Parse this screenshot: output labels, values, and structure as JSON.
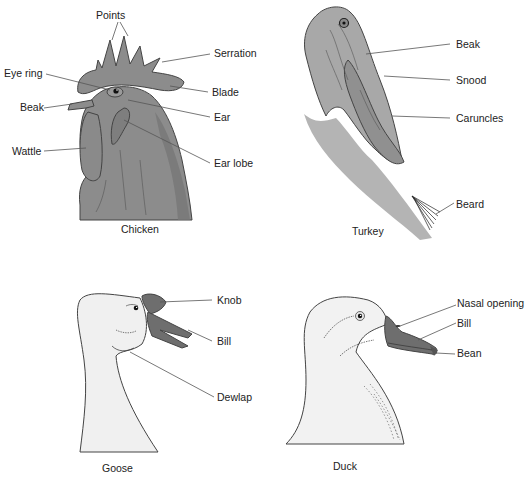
{
  "colors": {
    "background": "#ffffff",
    "chicken_fill": "#8c8c8c",
    "chicken_dark": "#6e6e6e",
    "turkey_fill": "#a8a8a8",
    "turkey_caruncle": "#8a8a8a",
    "bird_body": "#f2f2f2",
    "bill_fill": "#6e6e6e",
    "text": "#222222"
  },
  "panels": {
    "chicken": {
      "caption": "Chicken",
      "labels": {
        "points": "Points",
        "serration": "Serration",
        "eye_ring": "Eye ring",
        "blade": "Blade",
        "beak": "Beak",
        "ear": "Ear",
        "wattle": "Wattle",
        "ear_lobe": "Ear lobe"
      }
    },
    "turkey": {
      "caption": "Turkey",
      "labels": {
        "beak": "Beak",
        "snood": "Snood",
        "caruncles": "Caruncles",
        "beard": "Beard"
      }
    },
    "goose": {
      "caption": "Goose",
      "labels": {
        "knob": "Knob",
        "bill": "Bill",
        "dewlap": "Dewlap"
      }
    },
    "duck": {
      "caption": "Duck",
      "labels": {
        "nasal_opening": "Nasal opening",
        "bill": "Bill",
        "bean": "Bean"
      }
    }
  }
}
